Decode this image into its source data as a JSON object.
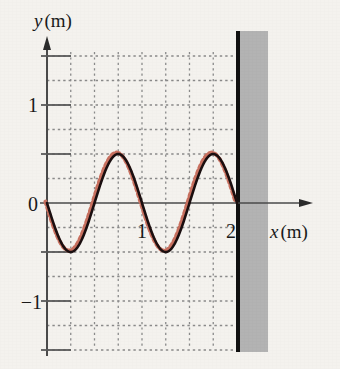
{
  "figure": {
    "caption_visible": false,
    "background_color": "#f4f2ee",
    "axis_color": "#4a4a4a",
    "grid_color": "#8a8a8a",
    "wave_color": "#1b0f10",
    "wave_dashed_color": "#c8705f",
    "wall_line_color": "#111111",
    "wall_fill_color": "#b3b3b3"
  },
  "labels": {
    "y_axis": {
      "variable": "y",
      "unit": "(m)"
    },
    "x_axis": {
      "variable": "x",
      "unit": "(m)"
    }
  },
  "chart_data": {
    "type": "line",
    "title": "",
    "xlabel": "x (m)",
    "ylabel": "y (m)",
    "xlim": [
      0,
      2.75
    ],
    "ylim": [
      -1.55,
      1.6
    ],
    "grid": true,
    "grid_step_x": 0.25,
    "grid_step_y": 0.25,
    "legend": "none",
    "x_ticks": [
      1,
      2
    ],
    "x_tick_labels": [
      "1",
      "2"
    ],
    "y_ticks": [
      -1,
      0,
      1
    ],
    "y_tick_labels": [
      "−1",
      "0",
      "1"
    ],
    "y_major_ticks": [
      -1.5,
      -1,
      -0.5,
      0,
      0.5,
      1,
      1.5
    ],
    "annotations": [
      {
        "name": "wall",
        "x": 2.0,
        "description": "rigid wall boundary at x = 2 m"
      }
    ],
    "series": [
      {
        "name": "wave-solid",
        "style": "solid",
        "color": "#1b0f10",
        "amplitude": -0.5,
        "wavelength": 1.0,
        "phase": 0,
        "x_start": 0,
        "x_end": 2.0,
        "formula": "y = -0.5*sin(2*pi*x)",
        "x": [
          0,
          0.125,
          0.25,
          0.375,
          0.5,
          0.625,
          0.75,
          0.875,
          1.0,
          1.125,
          1.25,
          1.375,
          1.5,
          1.625,
          1.75,
          1.875,
          2.0
        ],
        "y": [
          0,
          -0.354,
          -0.5,
          -0.354,
          0,
          0.354,
          0.5,
          0.354,
          0,
          -0.354,
          -0.5,
          -0.354,
          0,
          0.354,
          0.5,
          0.354,
          0
        ]
      },
      {
        "name": "wave-dashed",
        "style": "dashed",
        "color": "#c8705f",
        "amplitude": -0.5,
        "wavelength": 1.0,
        "phase": 0,
        "x_start": 0,
        "x_end": 2.0,
        "formula": "y = -0.5*sin(2*pi*x)",
        "x": [
          0,
          0.125,
          0.25,
          0.375,
          0.5,
          0.625,
          0.75,
          0.875,
          1.0,
          1.125,
          1.25,
          1.375,
          1.5,
          1.625,
          1.75,
          1.875,
          2.0
        ],
        "y": [
          0,
          -0.354,
          -0.5,
          -0.354,
          0,
          0.354,
          0.5,
          0.354,
          0,
          -0.354,
          -0.5,
          -0.354,
          0,
          0.354,
          0.5,
          0.354,
          0
        ]
      }
    ]
  }
}
